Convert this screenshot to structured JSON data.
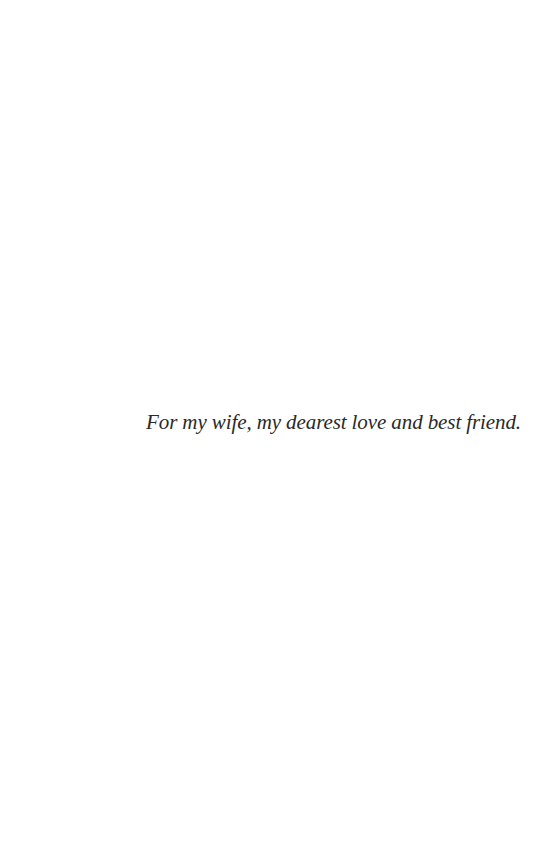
{
  "page": {
    "dedication": "For my wife, my dearest love and best friend."
  }
}
